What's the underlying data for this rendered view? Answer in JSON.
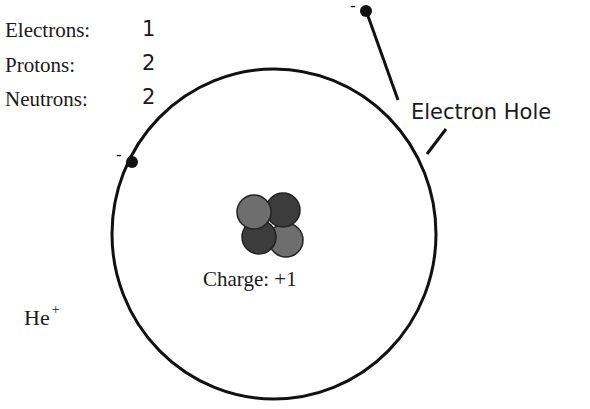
{
  "diagram": {
    "counts": [
      {
        "label": "Electrons:",
        "value": "1"
      },
      {
        "label": "Protons:",
        "value": "2"
      },
      {
        "label": "Neutrons:",
        "value": "2"
      }
    ],
    "electron_hole_label": "Electron Hole",
    "nucleus_charge_label": "Charge: +1",
    "ion_symbol": "He",
    "ion_superscript": "+",
    "electron_sign": "-",
    "colors": {
      "line": "#111111",
      "proton": "#6e6e6e",
      "neutron": "#3c3c3c",
      "background": "#ffffff"
    }
  }
}
